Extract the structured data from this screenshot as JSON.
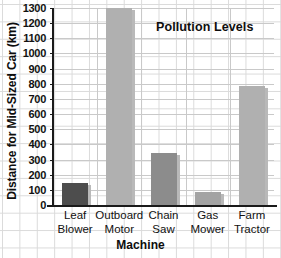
{
  "chart_data": {
    "type": "bar",
    "title": "Pollution Levels",
    "xlabel": "Machine",
    "ylabel": "Distance for Mid-Sized Car (km)",
    "categories": [
      "Leaf Blower",
      "Outboard Motor",
      "Chain Saw",
      "Gas Mower",
      "Farm Tractor"
    ],
    "category_lines": [
      [
        "Leaf",
        "Blower"
      ],
      [
        "Outboard",
        "Motor"
      ],
      [
        "Chain",
        "Saw"
      ],
      [
        "Gas",
        "Mower"
      ],
      [
        "Farm",
        "Tractor"
      ]
    ],
    "values": [
      145,
      1300,
      340,
      85,
      785
    ],
    "bar_colors": [
      "#4d4d4d",
      "#b0b0b0",
      "#8c8c8c",
      "#a3a3a3",
      "#b0b0b0"
    ],
    "ylim": [
      0,
      1300
    ],
    "ytick_values": [
      0,
      100,
      200,
      300,
      400,
      500,
      600,
      700,
      800,
      900,
      1000,
      1100,
      1200,
      1300
    ],
    "ytick_labels": [
      "0",
      "100",
      "200",
      "300",
      "400",
      "500",
      "600",
      "700",
      "800",
      "900",
      "1000",
      "1100",
      "1200",
      "1300"
    ],
    "grid": true,
    "legend": "none"
  }
}
